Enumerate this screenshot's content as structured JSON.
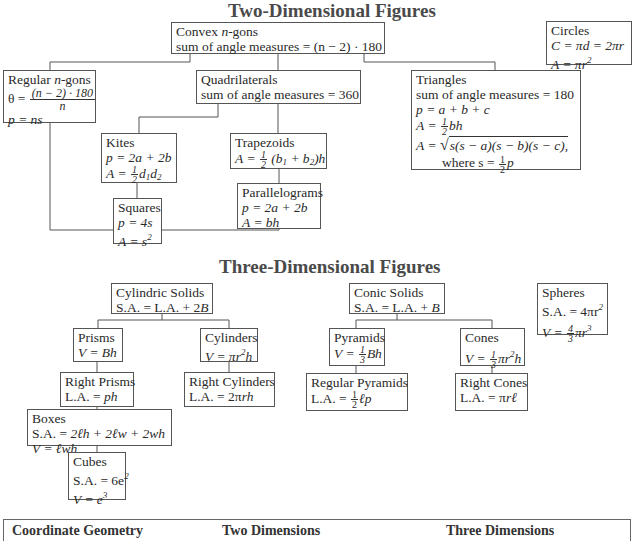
{
  "two_d": {
    "title": "Two-Dimensional Figures",
    "convex": {
      "name_pre": "Convex ",
      "name_var": "n",
      "name_post": "-gons",
      "formula": "sum of angle measures = (n − 2) · 180"
    },
    "circles": {
      "name": "Circles",
      "f1": "C = πd = 2πr",
      "f2_pre": "A = πr",
      "f2_exp": "2"
    },
    "regular": {
      "name_pre": "Regular ",
      "name_var": "n",
      "name_post": "-gons",
      "theta_lhs": "θ =",
      "theta_num": "(n − 2) · 180",
      "theta_den": "n",
      "f2": "p = ns"
    },
    "quadrilaterals": {
      "name": "Quadrilaterals",
      "formula": "sum of angle measures = 360"
    },
    "triangles": {
      "name": "Triangles",
      "f1": "sum of angle measures = 180",
      "f2": "p = a + b + c",
      "f3_lhs": "A =",
      "f3_num": "1",
      "f3_den": "2",
      "f3_rhs": "bh",
      "f4_lhs": "A =",
      "f4_rad": "s(s − a)(s − b)(s − c),",
      "f5_pre": "where s =",
      "f5_num": "1",
      "f5_den": "2",
      "f5_rhs": "p"
    },
    "kites": {
      "name": "Kites",
      "f1": "p = 2a + 2b",
      "f2_lhs": "A =",
      "f2_num": "1",
      "f2_den": "2",
      "f2_rhs1": "d",
      "f2_sub1": "1",
      "f2_rhs2": "d",
      "f2_sub2": "2"
    },
    "trapezoids": {
      "name": "Trapezoids",
      "f1_lhs": "A =",
      "f1_num": "1",
      "f1_den": "2",
      "f1_open": "(b",
      "f1_sub1": "1",
      "f1_mid": " + b",
      "f1_sub2": "2",
      "f1_close": ")h"
    },
    "parallelograms": {
      "name": "Parallelograms",
      "f1": "p = 2a + 2b",
      "f2": "A = bh"
    },
    "squares": {
      "name": "Squares",
      "f1": "p = 4s",
      "f2_pre": "A = s",
      "f2_exp": "2"
    }
  },
  "three_d": {
    "title": "Three-Dimensional Figures",
    "cylindric": {
      "name": "Cylindric Solids",
      "formula_pre": "S.A. = L.A. + 2",
      "formula_var": "B"
    },
    "conic": {
      "name": "Conic Solids",
      "formula_pre": "S.A. = L.A. + ",
      "formula_var": "B"
    },
    "spheres": {
      "name": "Spheres",
      "f1_pre": "S.A. = 4πr",
      "f1_exp": "2",
      "f2_lhs": "V =",
      "f2_num": "4",
      "f2_den": "3",
      "f2_rhs": "πr",
      "f2_exp": "3"
    },
    "prisms": {
      "name": "Prisms",
      "f1": "V = Bh"
    },
    "cylinders": {
      "name": "Cylinders",
      "f1_pre": "V = πr",
      "f1_exp": "2",
      "f1_post": "h"
    },
    "pyramids": {
      "name": "Pyramids",
      "f1_lhs": "V =",
      "f1_num": "1",
      "f1_den": "3",
      "f1_rhs": "Bh"
    },
    "cones": {
      "name": "Cones",
      "f1_lhs": "V =",
      "f1_num": "1",
      "f1_den": "3",
      "f1_rhs": "πr",
      "f1_exp": "2",
      "f1_post": "h"
    },
    "right_prisms": {
      "name": "Right Prisms",
      "f1_pre": "L.A. = ",
      "f1_var": "ph"
    },
    "right_cylinders": {
      "name": "Right Cylinders",
      "f1_pre": "L.A. = 2π",
      "f1_var": "rh"
    },
    "regular_pyramids": {
      "name": "Regular Pyramids",
      "f1_pre": "L.A. =",
      "f1_num": "1",
      "f1_den": "2",
      "f1_var": "ℓp"
    },
    "right_cones": {
      "name": "Right Cones",
      "f1_pre": "L.A. = π",
      "f1_var": "rℓ"
    },
    "boxes": {
      "name": "Boxes",
      "f1_pre": "S.A. = ",
      "f1_var": "2ℓh + 2ℓw + 2wh",
      "f2": "V = ℓwh"
    },
    "cubes": {
      "name": "Cubes",
      "f1_pre": "S.A. = 6e",
      "f1_exp": "2",
      "f2_pre": "V = e",
      "f2_exp": "3"
    }
  },
  "bottom_table": {
    "headers": [
      "Coordinate Geometry",
      "Two Dimensions",
      "Three Dimensions"
    ]
  }
}
